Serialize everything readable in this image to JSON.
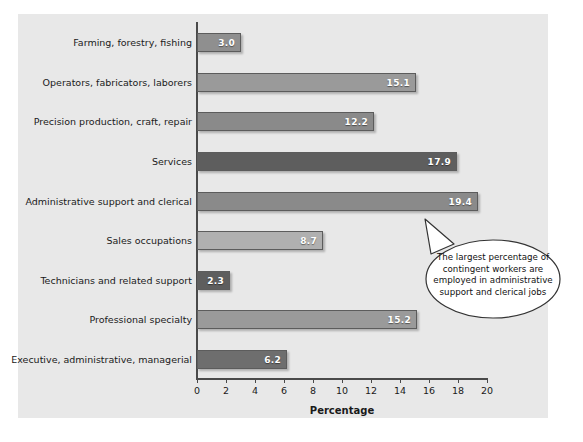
{
  "chart_data": {
    "type": "bar",
    "orientation": "horizontal",
    "title": "",
    "xlabel": "Percentage",
    "ylabel": "",
    "xlim": [
      0,
      20
    ],
    "xticks": [
      0,
      2,
      4,
      6,
      8,
      10,
      12,
      14,
      16,
      18,
      20
    ],
    "grid": false,
    "legend": null,
    "categories": [
      "Farming, forestry, fishing",
      "Operators, fabricators, laborers",
      "Precision production, craft, repair",
      "Services",
      "Administrative support and clerical",
      "Sales occupations",
      "Technicians and related support",
      "Professional specialty",
      "Executive, administrative, managerial"
    ],
    "values": [
      3.0,
      15.1,
      12.2,
      17.9,
      19.4,
      8.7,
      2.3,
      15.2,
      6.2
    ],
    "value_labels": [
      "3.0",
      "15.1",
      "12.2",
      "17.9",
      "19.4",
      "8.7",
      "2.3",
      "15.2",
      "6.2"
    ],
    "bar_colors": [
      "#8f8f8f",
      "#9a9a9a",
      "#8a8a8a",
      "#5e5e5e",
      "#8a8a8a",
      "#b0b0b0",
      "#5e5e5e",
      "#9a9a9a",
      "#6e6e6e"
    ],
    "annotations": [
      {
        "name": "callout-bubble",
        "text": "The largest percentage of contingent workers are employed in administrative support and clerical jobs",
        "lines": [
          "The largest percentage of",
          "contingent workers are",
          "employed in administrative",
          "support and clerical jobs"
        ],
        "points_to_category": "Administrative support and clerical",
        "points_to_value": 19.4
      }
    ]
  },
  "colors": {
    "panel_background": "#e8e8e8",
    "page_background": "#ffffff",
    "axis": "#4a4a4a",
    "bar_outline": "#5c5c5c",
    "value_label": "#ffffff",
    "text": "#1a1a1a",
    "callout_fill": "#ffffff",
    "callout_outline": "#333333"
  }
}
